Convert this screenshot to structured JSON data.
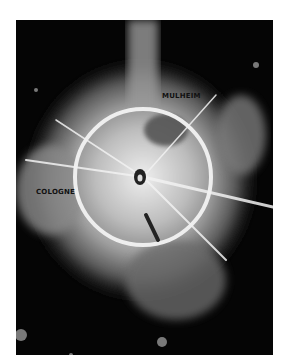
{
  "photo": {
    "description": "Aerial reconnaissance photograph showing a bright circular ring with radiating streaks over dark terrain",
    "labels": {
      "top": "MULHEIM",
      "left": "COLOGNE"
    },
    "colors": {
      "background": "#050505",
      "ring": "#e8e8e8",
      "page": "#ffffff"
    }
  }
}
